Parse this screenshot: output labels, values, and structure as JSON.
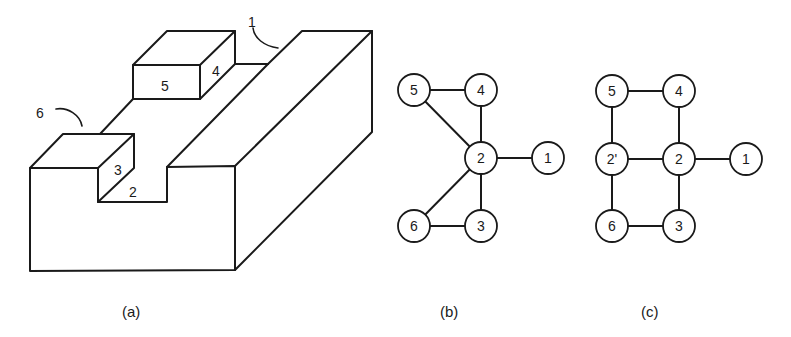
{
  "figure": {
    "panel_a": {
      "caption": "(a)",
      "face_labels": {
        "f1": "1",
        "f2": "2",
        "f3": "3",
        "f4": "4",
        "f5": "5",
        "f6": "6"
      }
    },
    "panel_b": {
      "caption": "(b)",
      "nodes": [
        "5",
        "4",
        "2",
        "1",
        "6",
        "3"
      ],
      "edges": [
        [
          "5",
          "4"
        ],
        [
          "5",
          "2"
        ],
        [
          "4",
          "2"
        ],
        [
          "2",
          "1"
        ],
        [
          "2",
          "6"
        ],
        [
          "2",
          "3"
        ],
        [
          "6",
          "3"
        ]
      ]
    },
    "panel_c": {
      "caption": "(c)",
      "nodes": [
        "5",
        "4",
        "2'",
        "2",
        "1",
        "6",
        "3"
      ],
      "edges": [
        [
          "5",
          "4"
        ],
        [
          "5",
          "2'"
        ],
        [
          "4",
          "2"
        ],
        [
          "2'",
          "2"
        ],
        [
          "2",
          "1"
        ],
        [
          "2'",
          "6"
        ],
        [
          "2",
          "3"
        ],
        [
          "6",
          "3"
        ]
      ]
    }
  }
}
